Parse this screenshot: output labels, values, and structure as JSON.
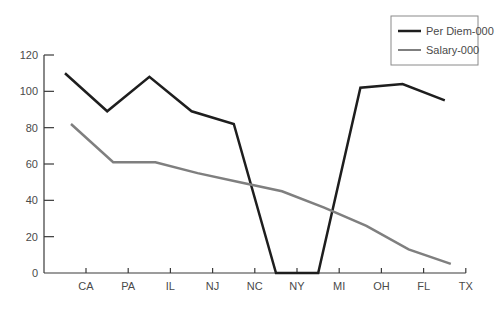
{
  "chart_data": {
    "type": "line",
    "title": "",
    "xlabel": "",
    "ylabel": "",
    "categories": [
      "CA",
      "PA",
      "IL",
      "NJ",
      "NC",
      "NY",
      "MI",
      "OH",
      "FL",
      "TX"
    ],
    "yticks": [
      0,
      20,
      40,
      60,
      80,
      100,
      120
    ],
    "ylim": [
      0,
      120
    ],
    "grid": false,
    "legend_position": "top-right",
    "series": [
      {
        "name": "Per Diem-000",
        "color": "#1e1e1e",
        "values": [
          110,
          89,
          108,
          89,
          82,
          0,
          0,
          102,
          104,
          95
        ]
      },
      {
        "name": "Salary-000",
        "color": "#7f7f7f",
        "values": [
          82,
          61,
          61,
          55,
          50,
          45,
          36,
          26,
          13,
          5
        ]
      }
    ]
  }
}
